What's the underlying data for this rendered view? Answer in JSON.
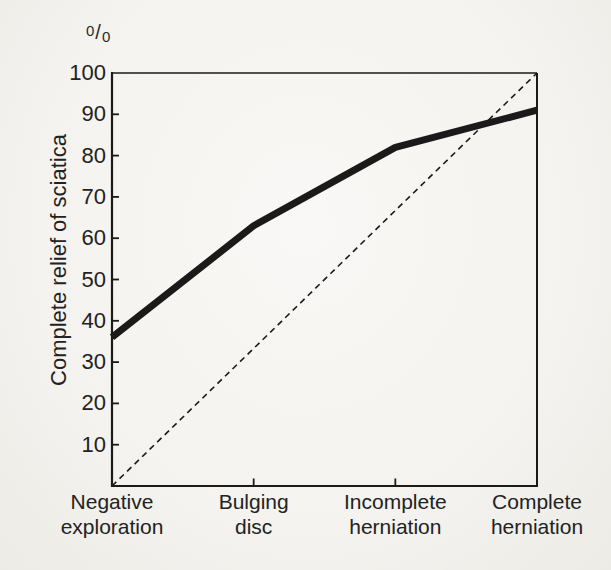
{
  "figure": {
    "background_color": "#f4f3ef",
    "ink_color": "#1a1a1a",
    "percent_sign": {
      "numerator": "0",
      "slash": "/",
      "denominator": "0"
    }
  },
  "chart_data": {
    "type": "line",
    "title": "",
    "xlabel": "",
    "ylabel": "Complete relief of sciatica",
    "y_unit": "%",
    "ylim": [
      0,
      100
    ],
    "y_ticks": [
      10,
      20,
      30,
      40,
      50,
      60,
      70,
      80,
      90,
      100
    ],
    "categories": [
      "Negative exploration",
      "Bulging disc",
      "Incomplete herniation",
      "Complete herniation"
    ],
    "series": [
      {
        "name": "Complete relief of sciatica",
        "style": "solid-thick",
        "values": [
          36,
          63,
          82,
          91
        ]
      },
      {
        "name": "Linear reference (diagonal)",
        "style": "dashed",
        "values": [
          0,
          33.3,
          66.7,
          100
        ]
      }
    ],
    "grid": false,
    "legend": false,
    "annotations": []
  }
}
